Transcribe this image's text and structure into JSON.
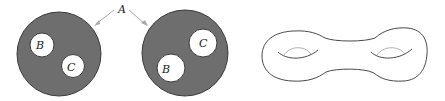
{
  "figure": {
    "label_a": "A",
    "left_disk": {
      "label_b": "B",
      "label_c": "C"
    },
    "right_disk": {
      "label_b": "B",
      "label_c": "C"
    },
    "right_shape": "double-torus (genus-2 surface)"
  },
  "colors": {
    "disk_fill": "#6e6e6e",
    "disk_stroke": "#3a3a3a",
    "hole_fill": "#ffffff",
    "outline": "#4a4a4a",
    "arrow": "#a8a8a8",
    "inner_arc_light": "#b0b0b0"
  }
}
